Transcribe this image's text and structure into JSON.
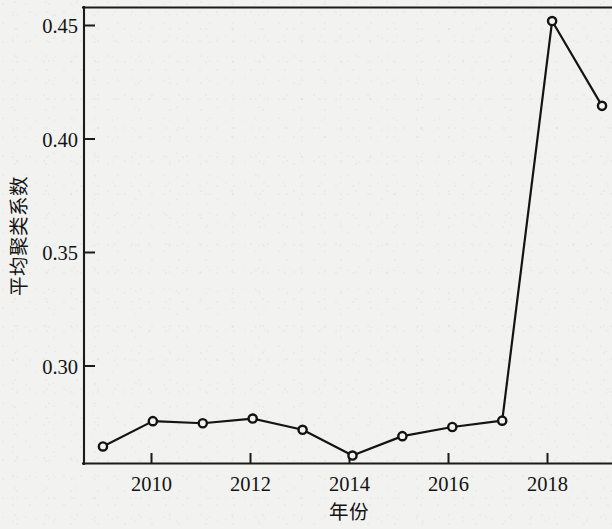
{
  "figure": {
    "background_color": "#f2f2f0",
    "ink_color": "#141414"
  },
  "axes": {
    "y_title": "平均聚类系数",
    "x_title": "年份",
    "y_ticks": [
      "0.45",
      "0.40",
      "0.35",
      "0.30"
    ],
    "x_ticks": [
      "2010",
      "2012",
      "2014",
      "2016",
      "2018"
    ]
  },
  "chart_data": {
    "type": "line",
    "title": "",
    "subtitle": "",
    "xlabel": "年份",
    "ylabel": "平均聚类系数",
    "x": [
      2009,
      2010,
      2011,
      2012,
      2013,
      2014,
      2015,
      2016,
      2017,
      2018,
      2019
    ],
    "values": [
      0.2687,
      0.2795,
      0.2786,
      0.2806,
      0.2758,
      0.2648,
      0.2731,
      0.277,
      0.2797,
      0.4503,
      0.4141
    ],
    "series": [
      {
        "name": "平均聚类系数",
        "values": [
          0.2687,
          0.2795,
          0.2786,
          0.2806,
          0.2758,
          0.2648,
          0.2731,
          0.277,
          0.2797,
          0.4503,
          0.4141
        ]
      }
    ],
    "xlim": [
      2008.62,
      2019.2
    ],
    "ylim": [
      0.2612,
      0.4563
    ],
    "x_tick_values": [
      2010,
      2012,
      2014,
      2016,
      2018
    ],
    "y_tick_values": [
      0.3,
      0.35,
      0.4,
      0.45
    ],
    "marker": "circle-open",
    "line_color": "#141414",
    "grid": false,
    "legend": null,
    "annotations": []
  }
}
